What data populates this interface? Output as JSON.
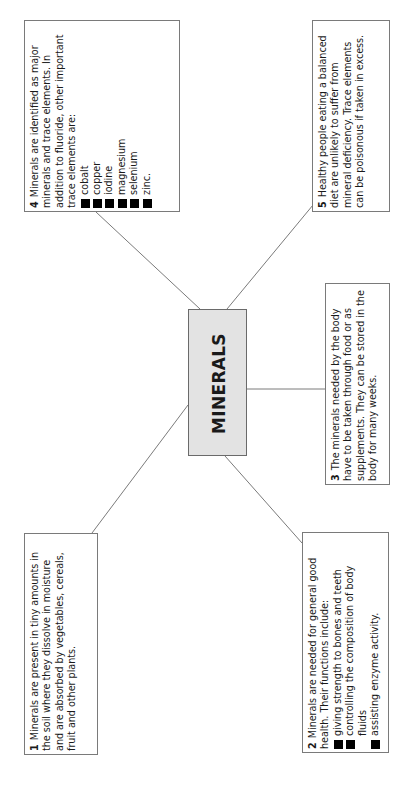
{
  "diagram": {
    "title": "MINERALS",
    "orientation": "rotated 90 degrees counter-clockwise",
    "colors": {
      "center_fill": "#e3e3e3",
      "border": "#7a7a7a",
      "line": "#7a7a7a",
      "bullet": "#000000"
    },
    "boxes": [
      {
        "number": "1",
        "text": "Minerals are present in tiny amounts in the soil where they dissolve in moisture and are absorbed by vegetables, cereals, fruit and other plants."
      },
      {
        "number": "2",
        "text": "Minerals are needed for general good health. Their functions include:",
        "bullets": [
          "giving strength to bones and teeth",
          "controlling the composition of body fluids",
          "assisting enzyme activity."
        ]
      },
      {
        "number": "3",
        "text": "The minerals needed by the body have to be taken through food or as supplements. They can be stored in the body for many weeks."
      },
      {
        "number": "4",
        "text": "Minerals are identified as major minerals and trace elements. In addition to fluoride, other important trace elements are:",
        "bullets": [
          "cobalt",
          "copper",
          "iodine",
          "magnesium",
          "selenium",
          "zinc."
        ]
      },
      {
        "number": "5",
        "text": "Healthy people eating a balanced diet are unlikely to suffer from mineral deficiency. Trace elements can be poisonous if taken in excess."
      }
    ]
  }
}
